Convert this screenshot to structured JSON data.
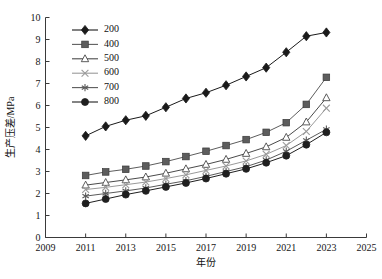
{
  "chart_data": {
    "type": "line",
    "title": "",
    "xlabel": "年份",
    "ylabel": "生产压差/MPa",
    "xlim": [
      2009,
      2025
    ],
    "ylim": [
      0,
      10
    ],
    "xticks": [
      2009,
      2011,
      2013,
      2015,
      2017,
      2019,
      2021,
      2023,
      2025
    ],
    "yticks": [
      0,
      1,
      2,
      3,
      4,
      5,
      6,
      7,
      8,
      9,
      10
    ],
    "grid": false,
    "legend_position": "upper-left-inside",
    "x": [
      2011,
      2012,
      2013,
      2014,
      2015,
      2016,
      2017,
      2018,
      2019,
      2020,
      2021,
      2022,
      2023
    ],
    "series": [
      {
        "name": "200",
        "marker": "filled-diamond",
        "color": "#1a1a1a",
        "values": [
          4.62,
          5.05,
          5.33,
          5.53,
          5.92,
          6.32,
          6.58,
          6.92,
          7.32,
          7.72,
          8.42,
          9.15,
          9.32
        ]
      },
      {
        "name": "400",
        "marker": "filled-square",
        "color": "#5d5d5d",
        "values": [
          2.82,
          2.98,
          3.1,
          3.25,
          3.45,
          3.68,
          3.92,
          4.18,
          4.45,
          4.78,
          5.22,
          6.05,
          7.28
        ]
      },
      {
        "name": "500",
        "marker": "open-triangle",
        "color": "#4a4a4a",
        "values": [
          2.38,
          2.5,
          2.62,
          2.75,
          2.92,
          3.12,
          3.32,
          3.55,
          3.82,
          4.12,
          4.55,
          5.25,
          6.35
        ]
      },
      {
        "name": "600",
        "marker": "cross-x",
        "color": "#9a9a9a",
        "values": [
          2.18,
          2.28,
          2.4,
          2.52,
          2.68,
          2.85,
          3.05,
          3.25,
          3.48,
          3.78,
          4.18,
          4.82,
          5.88
        ]
      },
      {
        "name": "700",
        "marker": "asterisk",
        "color": "#5a5a5a",
        "values": [
          1.88,
          2.0,
          2.12,
          2.25,
          2.42,
          2.58,
          2.78,
          3.0,
          3.22,
          3.52,
          3.92,
          4.42,
          4.92
        ]
      },
      {
        "name": "800",
        "marker": "filled-circle",
        "color": "#1f1f1f",
        "values": [
          1.55,
          1.75,
          1.95,
          2.12,
          2.3,
          2.48,
          2.68,
          2.9,
          3.12,
          3.4,
          3.72,
          4.22,
          4.78
        ]
      }
    ]
  },
  "legend": {
    "items": [
      {
        "label": "200"
      },
      {
        "label": "400"
      },
      {
        "label": "500"
      },
      {
        "label": "600"
      },
      {
        "label": "700"
      },
      {
        "label": "800"
      }
    ]
  }
}
